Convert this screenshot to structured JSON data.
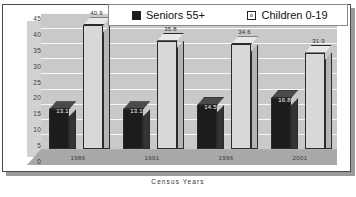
{
  "chart_data": {
    "type": "bar",
    "title": "",
    "xlabel": "Census Years",
    "ylabel": "",
    "categories": [
      "1986",
      "1991",
      "1996",
      "2001"
    ],
    "series": [
      {
        "name": "Seniors 55+",
        "values": [
          13.1,
          13.1,
          14.5,
          16.8
        ]
      },
      {
        "name": "Children 0-19",
        "values": [
          40.9,
          35.8,
          34.6,
          31.9
        ]
      }
    ],
    "ylim": [
      0,
      45
    ],
    "yticks": [
      "0",
      "5",
      "10",
      "15",
      "20",
      "25",
      "30",
      "35",
      "40",
      "45"
    ],
    "grid": true,
    "legend_position": "top",
    "style": "3d-column",
    "colors": {
      "seniors": "#1c1c1c",
      "children": "#d8d8d8",
      "background": "#c9c9c9"
    }
  },
  "legend": {
    "items": [
      {
        "label": "Seniors 55+",
        "swatch": "seniors-swatch-icon"
      },
      {
        "label": "Children 0-19",
        "swatch": "children-swatch-icon"
      }
    ]
  },
  "axis": {
    "x_title": "Census Years",
    "y_ticks": [
      "45",
      "40",
      "35",
      "30",
      "25",
      "20",
      "15",
      "10",
      "5",
      "0"
    ],
    "x_ticks": [
      "1986",
      "1991",
      "1996",
      "2001"
    ]
  },
  "labels": {
    "seniors": [
      "13.1",
      "13.1",
      "14.5",
      "16.8"
    ],
    "children": [
      "40.9",
      "35.8",
      "34.6",
      "31.9"
    ]
  }
}
